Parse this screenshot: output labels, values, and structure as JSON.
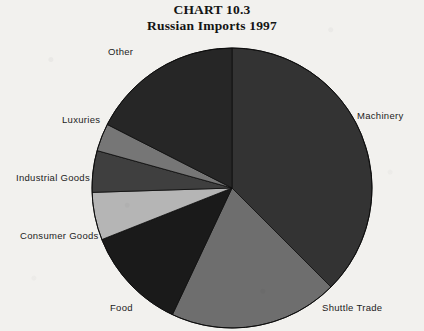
{
  "title": {
    "line1": "CHART 10.3",
    "line2": "Russian Imports 1997"
  },
  "chart_data": {
    "type": "pie",
    "title": "CHART 10.3 Russian Imports 1997",
    "xlabel": "",
    "ylabel": "",
    "legend_position": "none",
    "labels_position": "outside",
    "grid": false,
    "start_angle_deg": 0,
    "direction": "clockwise",
    "categories": [
      "Machinery",
      "Shuttle Trade",
      "Food",
      "Consumer Goods",
      "Industrial Goods",
      "Luxuries",
      "Other"
    ],
    "values": [
      37.5,
      19.5,
      12.0,
      5.5,
      4.8,
      3.2,
      17.5
    ],
    "unit": "percent",
    "slices": [
      {
        "label": "Machinery",
        "value": 37.5,
        "start_deg": 0.0,
        "end_deg": 135.0,
        "color": "#333333"
      },
      {
        "label": "Shuttle Trade",
        "value": 19.5,
        "start_deg": 135.0,
        "end_deg": 205.2,
        "color": "#6e6e6e"
      },
      {
        "label": "Food",
        "value": 12.0,
        "start_deg": 205.2,
        "end_deg": 248.4,
        "color": "#1a1a1a"
      },
      {
        "label": "Consumer Goods",
        "value": 5.5,
        "start_deg": 248.4,
        "end_deg": 268.2,
        "color": "#b5b5b5"
      },
      {
        "label": "Industrial Goods",
        "value": 4.8,
        "start_deg": 268.2,
        "end_deg": 285.5,
        "color": "#3f3f3f"
      },
      {
        "label": "Luxuries",
        "value": 3.2,
        "start_deg": 285.5,
        "end_deg": 297.0,
        "color": "#767676"
      },
      {
        "label": "Other",
        "value": 17.5,
        "start_deg": 297.0,
        "end_deg": 360.0,
        "color": "#262626"
      }
    ]
  },
  "geometry": {
    "center_x": 232,
    "center_y": 188,
    "radius": 140
  },
  "colors": {
    "background": "#f2f1ee",
    "text": "#1c1c1c",
    "title": "#141414",
    "outline": "#0d0d0d"
  }
}
